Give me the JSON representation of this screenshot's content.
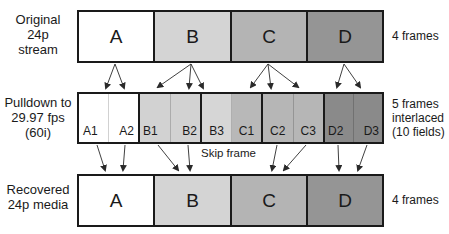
{
  "rows": {
    "original": {
      "label": [
        "Original",
        "24p",
        "stream"
      ],
      "right_label": "4 frames",
      "frames": [
        {
          "name": "A",
          "color": "#ffffff"
        },
        {
          "name": "B",
          "color": "#d4d4d4"
        },
        {
          "name": "C",
          "color": "#b4b4b4"
        },
        {
          "name": "D",
          "color": "#959595"
        }
      ]
    },
    "pulldown": {
      "label": [
        "Pulldown to",
        "29.97 fps",
        "(60i)"
      ],
      "right_label": [
        "5 frames",
        "interlaced",
        "(10 fields)"
      ],
      "frames": [
        {
          "fields": [
            {
              "name": "A1",
              "color": "#ffffff",
              "align": "left"
            },
            {
              "name": "A2",
              "color": "#ffffff",
              "align": "right"
            }
          ]
        },
        {
          "fields": [
            {
              "name": "B1",
              "color": "#d2d2d2",
              "align": "left"
            },
            {
              "name": "B2",
              "color": "#d2d2d2",
              "align": "right"
            }
          ]
        },
        {
          "fields": [
            {
              "name": "B3",
              "color": "#d6d6d6",
              "align": "center"
            },
            {
              "name": "C1",
              "color": "#b8b8b8",
              "align": "center"
            }
          ]
        },
        {
          "fields": [
            {
              "name": "C2",
              "color": "#b6b6b6",
              "align": "center"
            },
            {
              "name": "C3",
              "color": "#b6b6b6",
              "align": "center"
            }
          ]
        },
        {
          "fields": [
            {
              "name": "D2",
              "color": "#8a8a8a",
              "align": "left"
            },
            {
              "name": "D3",
              "color": "#8a8a8a",
              "align": "right"
            }
          ]
        }
      ],
      "annotation": "Skip frame"
    },
    "recovered": {
      "label": [
        "Recovered",
        "24p media"
      ],
      "right_label": "4 frames",
      "frames": [
        {
          "name": "A",
          "color": "#ffffff"
        },
        {
          "name": "B",
          "color": "#d4d4d4"
        },
        {
          "name": "C",
          "color": "#b4b4b4"
        },
        {
          "name": "D",
          "color": "#959595"
        }
      ]
    }
  },
  "colors": {
    "border": "#1a1a1a",
    "arrow": "#2a2a2a"
  }
}
